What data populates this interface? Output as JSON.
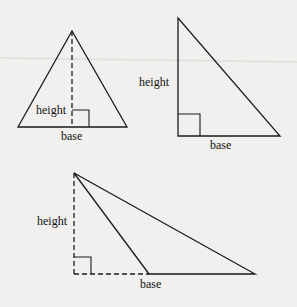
{
  "figure": {
    "triangles": [
      {
        "id": "acute-isosceles",
        "labels": {
          "height": "height",
          "base": "base"
        },
        "height_style": "dashed-interior"
      },
      {
        "id": "right",
        "labels": {
          "height": "height",
          "base": "base"
        },
        "height_style": "solid-side"
      },
      {
        "id": "obtuse",
        "labels": {
          "height": "height",
          "base": "base"
        },
        "height_style": "dashed-exterior"
      }
    ]
  },
  "colors": {
    "background": "#f1f0ee",
    "ink": "#1a1a1a"
  }
}
